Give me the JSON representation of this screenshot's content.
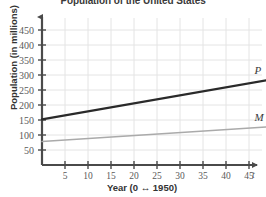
{
  "chart_data": {
    "type": "line",
    "title": "Population of the United States",
    "xlabel": "Year (0 ↔ 1950)",
    "ylabel": "Population (in millions)",
    "xlim": [
      0,
      49
    ],
    "ylim": [
      0,
      470
    ],
    "grid": true,
    "legend": "inline-end-labels",
    "x_axis_end_label": "t",
    "xticks": [
      5,
      10,
      15,
      20,
      25,
      30,
      35,
      40,
      45
    ],
    "xtick_labels": [
      "5",
      "10",
      "15",
      "20",
      "25",
      "30",
      "35",
      "40",
      "45"
    ],
    "yticks": [
      50,
      100,
      150,
      200,
      250,
      300,
      350,
      400,
      450
    ],
    "ytick_labels": [
      "50",
      "100",
      "150",
      "200",
      "250",
      "300",
      "350",
      "400",
      "450"
    ],
    "series": [
      {
        "name": "P",
        "label": "P",
        "color": "#2a2a2a",
        "x": [
          0,
          49
        ],
        "values": [
          152,
          283
        ]
      },
      {
        "name": "M",
        "label": "M",
        "color": "#aaaaaa",
        "x": [
          0,
          49
        ],
        "values": [
          78,
          127
        ]
      }
    ]
  },
  "colors": {
    "background": "#ffffff",
    "grid": "#e4e4e4",
    "axis": "#4a4a4a",
    "series_p": "#2a2a2a",
    "series_m": "#aaaaaa",
    "tick_text": "#5a5a5a",
    "label_text": "#333333"
  }
}
